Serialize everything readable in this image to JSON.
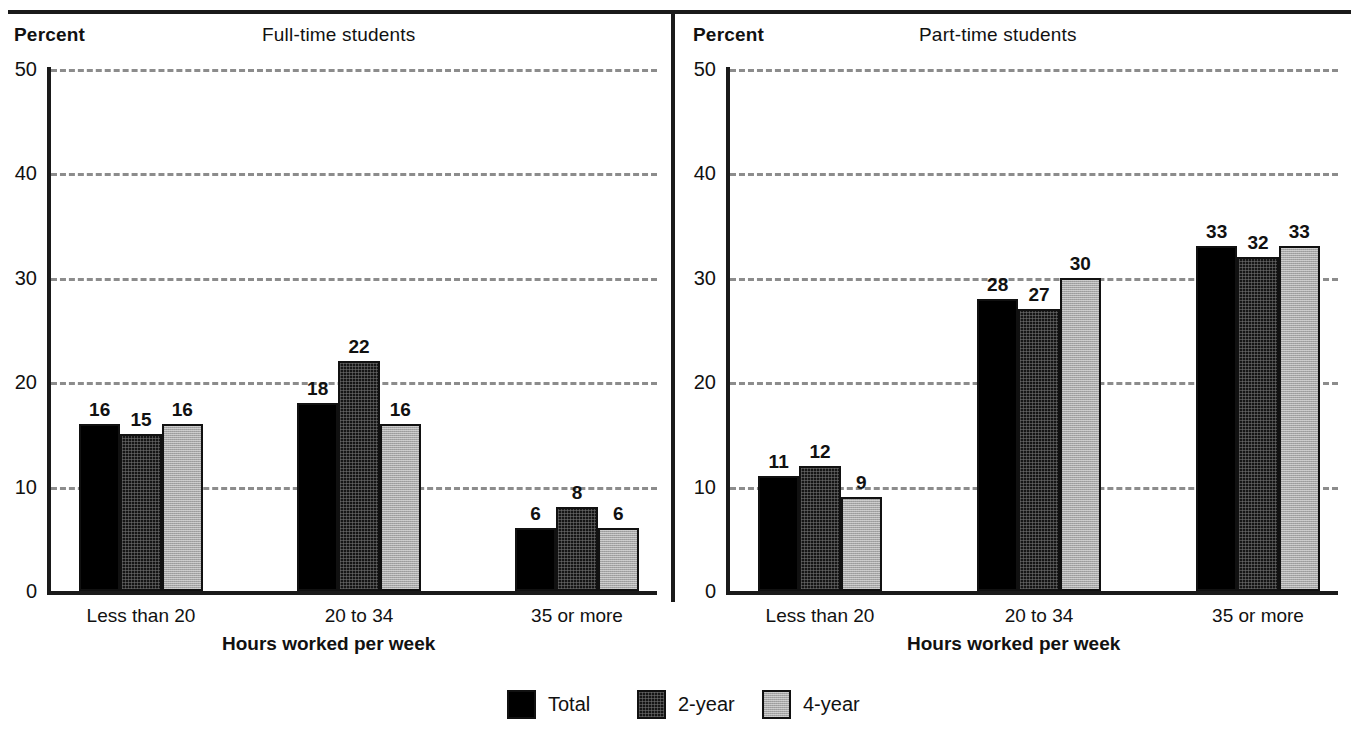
{
  "chart_data": {
    "type": "bar",
    "xlabel": "Hours worked per week",
    "ylabel": "Percent",
    "ylim": [
      0,
      50
    ],
    "yticks": [
      0,
      10,
      20,
      30,
      40,
      50
    ],
    "grid": true,
    "legend_position": "bottom",
    "categories": [
      "Less than 20",
      "20 to 34",
      "35 or more"
    ],
    "series_names": [
      "Total",
      "2-year",
      "4-year"
    ],
    "panels": [
      {
        "title": "Full-time students",
        "ylabel": "Percent",
        "xlabel": "Hours worked per week",
        "categories": [
          "Less than 20",
          "20 to 34",
          "35 or more"
        ],
        "series": [
          {
            "name": "Total",
            "values": [
              16,
              18,
              6
            ]
          },
          {
            "name": "2-year",
            "values": [
              15,
              22,
              8
            ]
          },
          {
            "name": "4-year",
            "values": [
              16,
              16,
              6
            ]
          }
        ]
      },
      {
        "title": "Part-time students",
        "ylabel": "Percent",
        "xlabel": "Hours worked per week",
        "categories": [
          "Less than 20",
          "20 to 34",
          "35 or more"
        ],
        "series": [
          {
            "name": "Total",
            "values": [
              11,
              28,
              33
            ]
          },
          {
            "name": "2-year",
            "values": [
              12,
              27,
              32
            ]
          },
          {
            "name": "4-year",
            "values": [
              9,
              30,
              33
            ]
          }
        ]
      }
    ],
    "colors": {
      "total": "#000000",
      "two_year": "#151515",
      "four_year": "#a7a7a7",
      "axis": "#1a1a1a",
      "gridline": "#8c8c8c",
      "text": "#111111",
      "background": "#ffffff"
    }
  },
  "legend": {
    "items": [
      {
        "label": "Total",
        "swatch": "solid-black-swatch"
      },
      {
        "label": "2-year",
        "swatch": "dark-textured-swatch"
      },
      {
        "label": "4-year",
        "swatch": "light-gray-swatch"
      }
    ]
  }
}
